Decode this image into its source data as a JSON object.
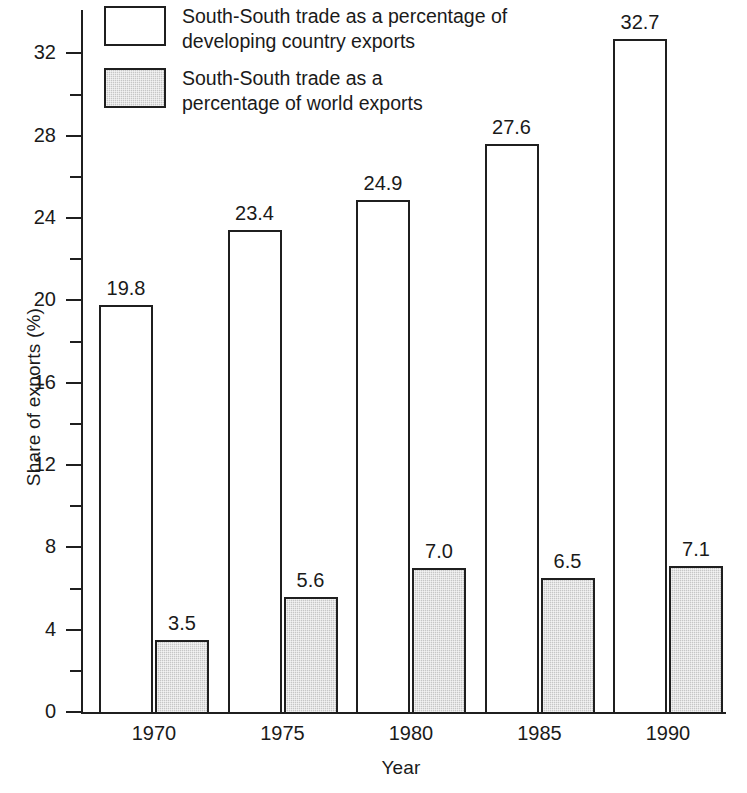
{
  "chart_data": {
    "type": "bar",
    "title": "",
    "subtitle": "",
    "xlabel": "Year",
    "ylabel": "Share of exports (%)",
    "categories": [
      "1970",
      "1975",
      "1980",
      "1985",
      "1990"
    ],
    "series": [
      {
        "name": "South-South trade as a percentage of developing country exports",
        "values": [
          19.8,
          23.4,
          24.9,
          27.6,
          32.7
        ],
        "labels": [
          "19.8",
          "23.4",
          "24.9",
          "27.6",
          "32.7"
        ],
        "fill": "white",
        "stroke": "#1f1f1f"
      },
      {
        "name": "South-South trade as a percentage of world exports",
        "values": [
          3.5,
          5.6,
          7.0,
          6.5,
          7.1
        ],
        "labels": [
          "3.5",
          "5.6",
          "7.0",
          "6.5",
          "7.1"
        ],
        "fill": "#c6c6c6",
        "stroke": "#1f1f1f"
      }
    ],
    "ylim": [
      0,
      34.2
    ],
    "yticks_major": [
      0,
      4,
      8,
      12,
      16,
      20,
      24,
      28,
      32
    ],
    "yticks_major_labels": [
      "0",
      "4",
      "8",
      "12",
      "16",
      "20",
      "24",
      "28",
      "32"
    ],
    "yticks_minor": [
      2,
      6,
      10,
      14,
      18,
      22,
      26,
      30
    ],
    "grid": false,
    "legend_position": "top-left"
  },
  "legend": {
    "entries": [
      {
        "swatch": "open-square",
        "line1": "South-South trade as a percentage of",
        "line2": "developing country exports"
      },
      {
        "swatch": "shaded-square",
        "line1": "South-South trade as a",
        "line2": "percentage of world exports"
      }
    ]
  },
  "colors": {
    "ink": "#1f1f1f",
    "shaded_fill": "#c6c6c6",
    "open_fill": "#ffffff",
    "background": "#ffffff"
  }
}
